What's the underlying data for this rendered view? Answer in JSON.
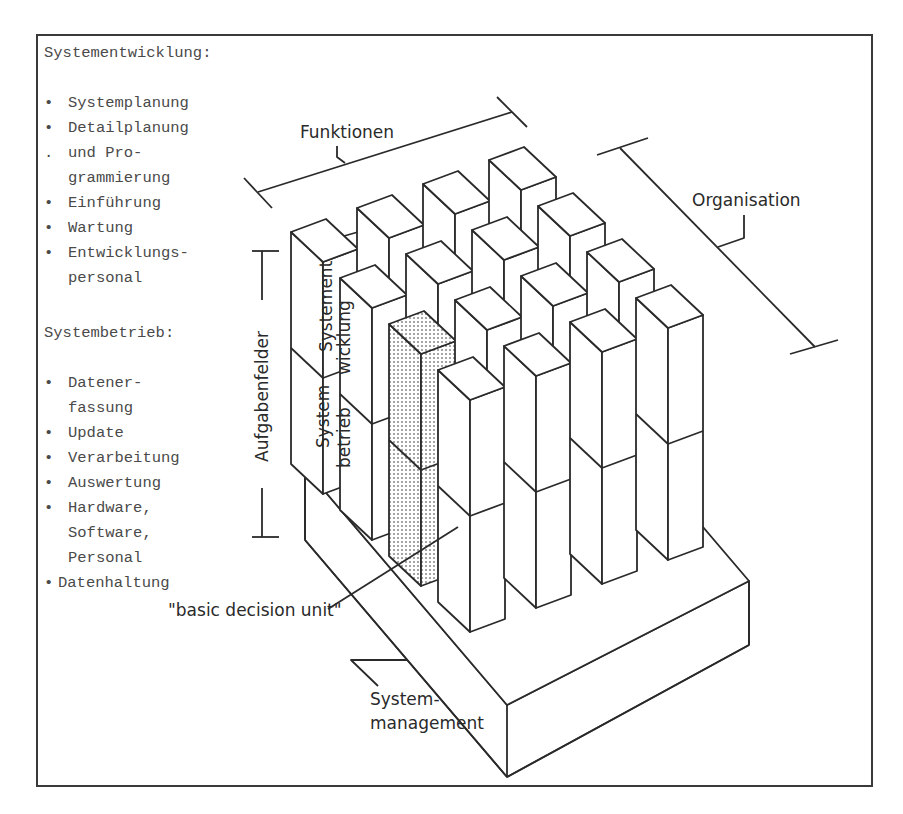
{
  "left_panel": {
    "systementwicklung": {
      "heading": "Systementwicklung:",
      "items": [
        {
          "bullet": "•",
          "lines": [
            "Systemplanung"
          ]
        },
        {
          "bullet": "•",
          "lines": [
            "Detailplanung"
          ]
        },
        {
          "bullet": ".",
          "lines": [
            "und Pro-",
            "grammierung"
          ]
        },
        {
          "bullet": "•",
          "lines": [
            "Einführung"
          ]
        },
        {
          "bullet": "•",
          "lines": [
            "Wartung"
          ]
        },
        {
          "bullet": "•",
          "lines": [
            "Entwicklungs-",
            "personal"
          ]
        }
      ]
    },
    "systembetrieb": {
      "heading": "Systembetrieb:",
      "items": [
        {
          "bullet": "•",
          "lines": [
            "Datener-",
            "fassung"
          ]
        },
        {
          "bullet": "•",
          "lines": [
            "Update"
          ]
        },
        {
          "bullet": "•",
          "lines": [
            "Verarbeitung"
          ]
        },
        {
          "bullet": "•",
          "lines": [
            "Auswertung"
          ]
        },
        {
          "bullet": "•",
          "lines": [
            "Hardware,",
            "Software,",
            "Personal"
          ]
        },
        {
          "bullet": "•",
          "lines": [
            "Datenhaltung"
          ]
        }
      ]
    }
  },
  "diagram": {
    "dimension_labels": {
      "funktionen": "Funktionen",
      "organisation": "Organisation",
      "aufgabenfelder": "Aufgabenfelder"
    },
    "layer_labels": {
      "systementwicklung_1": "Systement",
      "systementwicklung_2": "wicklung",
      "systembetrieb_1": "System",
      "systembetrieb_2": "betrieb"
    },
    "callouts": {
      "basic_decision_unit": "\"basic decision unit\"",
      "systemmanagement_1": "System-",
      "systemmanagement_2": "management"
    },
    "grid": {
      "rows": 4,
      "columns": 4,
      "layers": 2,
      "highlighted_cell": "front-left column, row 2 (dotted)"
    }
  }
}
